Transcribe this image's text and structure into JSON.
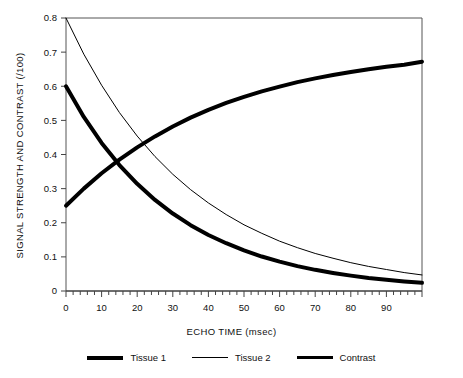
{
  "chart_data": {
    "type": "line",
    "title": "",
    "xlabel": "ECHO TIME (msec)",
    "ylabel": "SIGNAL STRENGTH AND CONTRAST (/100)",
    "xlim": [
      0,
      100
    ],
    "ylim": [
      0,
      0.8
    ],
    "grid": false,
    "legend_position": "bottom",
    "x_ticks": [
      "0",
      "10",
      "20",
      "30",
      "40",
      "50",
      "60",
      "70",
      "80",
      "90"
    ],
    "x_tick_values": [
      0,
      10,
      20,
      30,
      40,
      50,
      60,
      70,
      80,
      90
    ],
    "x_minor_tick_step": 2,
    "y_ticks": [
      "0",
      "0.1",
      "0.2",
      "0.3",
      "0.4",
      "0.5",
      "0.6",
      "0.7",
      "0.8"
    ],
    "y_tick_values": [
      0,
      0.1,
      0.2,
      0.3,
      0.4,
      0.5,
      0.6,
      0.7,
      0.8
    ],
    "x": [
      0,
      5,
      10,
      15,
      20,
      25,
      30,
      35,
      40,
      45,
      50,
      55,
      60,
      65,
      70,
      75,
      80,
      85,
      90,
      95,
      100
    ],
    "series": [
      {
        "name": "Tissue 1",
        "style": "thick",
        "color": "#000000",
        "linewidth": 4,
        "values": [
          0.6,
          0.51,
          0.434,
          0.369,
          0.314,
          0.267,
          0.227,
          0.193,
          0.164,
          0.14,
          0.119,
          0.101,
          0.086,
          0.073,
          0.062,
          0.053,
          0.045,
          0.038,
          0.033,
          0.028,
          0.024
        ]
      },
      {
        "name": "Tissue 2",
        "style": "thin",
        "color": "#000000",
        "linewidth": 1,
        "values": [
          0.8,
          0.694,
          0.603,
          0.523,
          0.454,
          0.394,
          0.342,
          0.297,
          0.258,
          0.224,
          0.194,
          0.169,
          0.146,
          0.127,
          0.11,
          0.096,
          0.083,
          0.072,
          0.063,
          0.054,
          0.047
        ]
      },
      {
        "name": "Contrast",
        "style": "thick",
        "color": "#000000",
        "linewidth": 4,
        "values": [
          0.25,
          0.3,
          0.345,
          0.385,
          0.421,
          0.453,
          0.482,
          0.508,
          0.531,
          0.551,
          0.569,
          0.585,
          0.599,
          0.612,
          0.623,
          0.633,
          0.642,
          0.65,
          0.657,
          0.663,
          0.672
        ]
      }
    ],
    "legend": [
      {
        "label": "Tissue 1",
        "style": "thick"
      },
      {
        "label": "Tissue 2",
        "style": "thin"
      },
      {
        "label": "Contrast",
        "style": "med"
      }
    ]
  },
  "axis": {
    "xlabel": "ECHO TIME (msec)",
    "ylabel": "SIGNAL STRENGTH AND CONTRAST (/100)"
  },
  "legend": {
    "item0": "Tissue 1",
    "item1": "Tissue 2",
    "item2": "Contrast"
  }
}
